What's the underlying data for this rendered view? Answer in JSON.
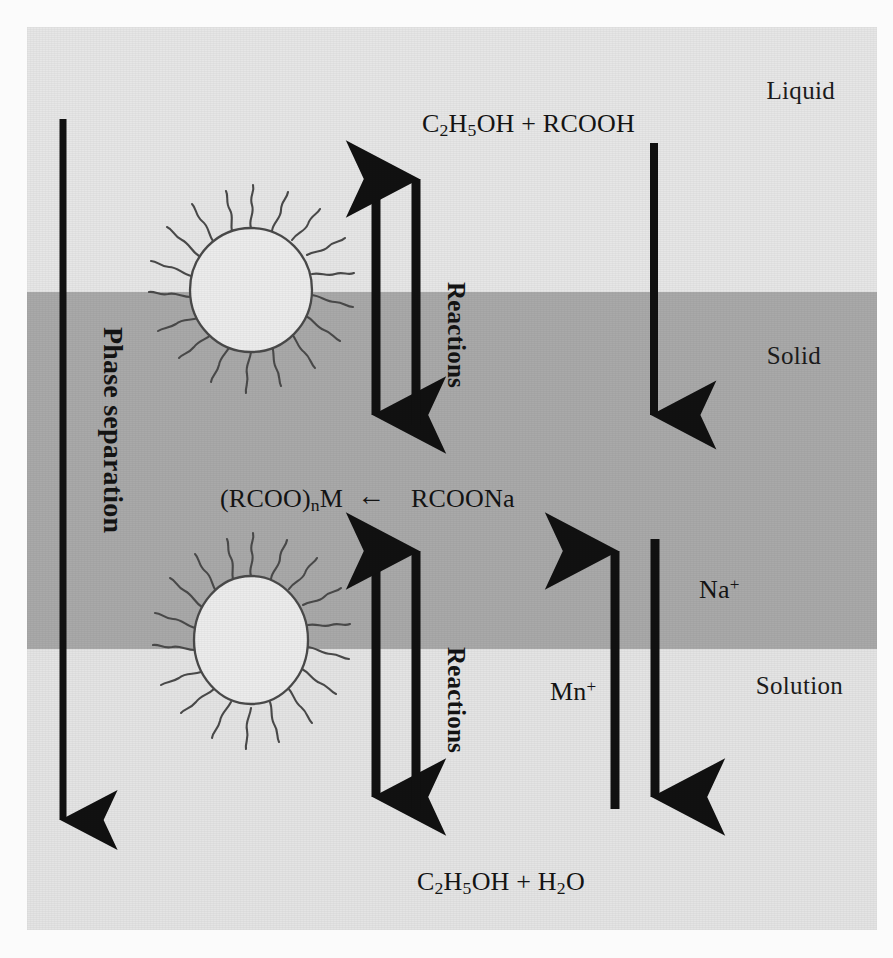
{
  "figure": {
    "phases": [
      {
        "id": "liquid",
        "label": "Liquid",
        "color": "#e6e6e6"
      },
      {
        "id": "solid",
        "label": "Solid",
        "color": "#a9a9a9"
      },
      {
        "id": "solution",
        "label": "Solution",
        "color": "#e4e4e4"
      }
    ],
    "formulas": {
      "top": "C2H5OH + RCOOH",
      "top_parts": {
        "c": "C",
        "c_sub": "2",
        "h": "H",
        "h_sub": "5",
        "oh": "OH",
        "plus": " + ",
        "acid": "RCOOH"
      },
      "bottom": "C2H5OH + H2O",
      "bottom_parts": {
        "c": "C",
        "c_sub": "2",
        "h": "H",
        "h_sub": "5",
        "oh": "OH",
        "plus": " + ",
        "water_h": "H",
        "water_sub": "2",
        "water_o": "O"
      },
      "middle_left": "(RCOO)nM",
      "middle_left_parts": {
        "open": "(RCOO)",
        "sub": "n",
        "metal": "M"
      },
      "middle_right": "RCOONa",
      "middle_arrow": "←"
    },
    "vertical_labels": {
      "phase_separation": "Phase separation",
      "reactions_upper": "Reactions",
      "reactions_lower": "Reactions"
    },
    "ion_labels": {
      "sodium": "Na",
      "sodium_charge": "+",
      "metal": "Mn",
      "metal_charge": "+"
    },
    "micelles": [
      {
        "id": "micelle-upper",
        "cx": 224,
        "cy": 263,
        "rx": 61,
        "ry": 62,
        "tails": 18
      },
      {
        "id": "micelle-lower",
        "cx": 224,
        "cy": 613,
        "rx": 57,
        "ry": 64,
        "tails": 18
      }
    ],
    "colors": {
      "liquid_band": "#e6e6e6",
      "solid_band": "#a9a9a9",
      "solution_band": "#e4e4e4",
      "arrow_stroke": "#111111",
      "micelle_fill": "#ececec",
      "micelle_stroke": "#4a4a4a",
      "text": "#141414",
      "boundary_line": "#6d6d6d"
    },
    "arrows": [
      {
        "id": "phase-separation-arrow",
        "x": 36,
        "y1": 92,
        "y2": 805,
        "direction": "down"
      },
      {
        "id": "reaction-down-upper",
        "x": 349,
        "y1": 140,
        "y2": 400,
        "direction": "down"
      },
      {
        "id": "reaction-up-upper",
        "x": 389,
        "y1": 398,
        "y2": 142,
        "direction": "up"
      },
      {
        "id": "rcoona-down-arrow",
        "x": 627,
        "y1": 116,
        "y2": 400,
        "direction": "down"
      },
      {
        "id": "reaction-down-lower",
        "x": 349,
        "y1": 512,
        "y2": 782,
        "direction": "down"
      },
      {
        "id": "reaction-up-lower",
        "x": 389,
        "y1": 782,
        "y2": 512,
        "direction": "up"
      },
      {
        "id": "metal-ion-up-arrow",
        "x": 588,
        "y1": 782,
        "y2": 512,
        "direction": "up"
      },
      {
        "id": "sodium-ion-down-arrow",
        "x": 628,
        "y1": 512,
        "y2": 782,
        "direction": "down"
      }
    ]
  }
}
